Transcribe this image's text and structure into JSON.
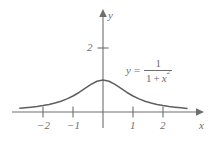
{
  "figure": {
    "background_color": "#ffffff",
    "ink_color": "#6e6e6e",
    "curve_color": "#5f5f5f"
  },
  "axes": {
    "x_axis_name": "x",
    "y_axis_name": "y",
    "origin_px": {
      "x": 103,
      "y": 112
    },
    "x_unit_px": 30,
    "y_unit_px": 32,
    "x_ticks": [
      {
        "value": -2,
        "label": "−2",
        "px": 43
      },
      {
        "value": -1,
        "label": "−1",
        "px": 73
      },
      {
        "value": 1,
        "label": "1",
        "px": 133
      },
      {
        "value": 2,
        "label": "2",
        "px": 163
      }
    ],
    "y_ticks": [
      {
        "value": 2,
        "label": "2",
        "px": 48
      }
    ],
    "x_range": [
      -3.2,
      3.1
    ],
    "y_range": [
      -0.2,
      3.2
    ],
    "grid": false
  },
  "equation": {
    "lhs": "y",
    "equals": "=",
    "numerator": "1",
    "denominator_one": "1",
    "denominator_plus": "+",
    "denominator_var": "x",
    "denominator_exponent": "2"
  },
  "chart_data": {
    "type": "line",
    "title": "",
    "xlabel": "x",
    "ylabel": "y",
    "xlim": [
      -3.2,
      3.1
    ],
    "ylim": [
      -0.2,
      3.2
    ],
    "grid": false,
    "legend_position": "inside-right",
    "annotations": [
      {
        "text": "y = 1/(1 + x^2)",
        "x": 0.85,
        "y": 1.6
      }
    ],
    "xticks": [
      -2,
      -1,
      1,
      2
    ],
    "xticklabels": [
      "−2",
      "−1",
      "1",
      "2"
    ],
    "yticks": [
      2
    ],
    "yticklabels": [
      "2"
    ],
    "series": [
      {
        "name": "y = 1/(1 + x^2)",
        "formula": "1/(1 + x^2)",
        "color": "#5f5f5f",
        "x": [
          -2.77,
          -2.6,
          -2.4,
          -2.2,
          -2.0,
          -1.8,
          -1.6,
          -1.4,
          -1.2,
          -1.0,
          -0.8,
          -0.6,
          -0.4,
          -0.2,
          0.0,
          0.2,
          0.4,
          0.6,
          0.8,
          1.0,
          1.2,
          1.4,
          1.6,
          1.8,
          2.0,
          2.2,
          2.4,
          2.6,
          2.8
        ],
        "y": [
          0.115,
          0.129,
          0.148,
          0.171,
          0.2,
          0.236,
          0.281,
          0.338,
          0.41,
          0.5,
          0.61,
          0.735,
          0.862,
          0.962,
          1.0,
          0.962,
          0.862,
          0.735,
          0.61,
          0.5,
          0.41,
          0.338,
          0.281,
          0.236,
          0.2,
          0.171,
          0.148,
          0.129,
          0.113
        ]
      }
    ]
  }
}
